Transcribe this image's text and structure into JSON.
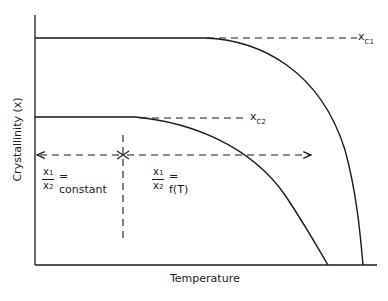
{
  "diagram": {
    "axes": {
      "y_label": "Crystallinity (x)",
      "x_label": "Temperature"
    },
    "curves": [
      {
        "name": "x_C1",
        "label_main": "x",
        "label_sub": "C1"
      },
      {
        "name": "x_C2",
        "label_main": "x",
        "label_sub": "C2"
      }
    ],
    "regions": {
      "left": {
        "numerator": "x",
        "numerator_sub": "1",
        "denominator": "x",
        "denominator_sub": "2",
        "relation": "= constant"
      },
      "right": {
        "numerator": "x",
        "numerator_sub": "1",
        "denominator": "x",
        "denominator_sub": "2",
        "relation": "= f(T)"
      }
    },
    "colors": {
      "line": "#1a1a1a",
      "background": "#ffffff"
    }
  }
}
